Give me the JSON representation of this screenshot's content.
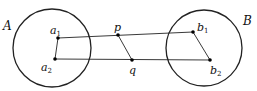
{
  "diagram": {
    "circles": [
      {
        "id": "A",
        "label": "A",
        "cx": 52,
        "cy": 48,
        "r": 39
      },
      {
        "id": "B",
        "label": "B",
        "cx": 204,
        "cy": 48,
        "r": 38
      }
    ],
    "points": {
      "a1": {
        "x": 58,
        "y": 38,
        "base": "a",
        "sub": "1"
      },
      "a2": {
        "x": 55,
        "y": 59,
        "base": "a",
        "sub": "2"
      },
      "p": {
        "x": 118,
        "y": 35,
        "base": "p",
        "sub": ""
      },
      "q": {
        "x": 132,
        "y": 60,
        "base": "q",
        "sub": ""
      },
      "b1": {
        "x": 193,
        "y": 32,
        "base": "b",
        "sub": "1"
      },
      "b2": {
        "x": 210,
        "y": 60,
        "base": "b",
        "sub": "2"
      }
    },
    "segments": [
      [
        "a1",
        "b1"
      ],
      [
        "a2",
        "b2"
      ],
      [
        "a1",
        "a2"
      ],
      [
        "p",
        "q"
      ],
      [
        "b1",
        "b2"
      ]
    ],
    "stroke": "#222222"
  }
}
